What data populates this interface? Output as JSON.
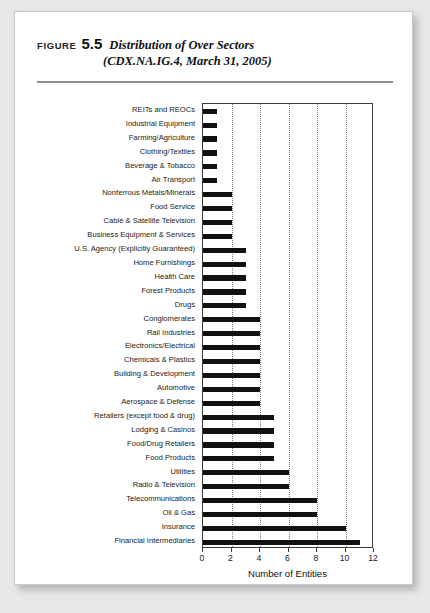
{
  "figure": {
    "label": "FIGURE",
    "number": "5.5",
    "title_line1": "Distribution of Over Sectors",
    "title_line2": "(CDX.NA.IG.4, March 31, 2005)"
  },
  "chart_data": {
    "type": "bar",
    "orientation": "horizontal",
    "title": "Distribution of Over Sectors (CDX.NA.IG.4, March 31, 2005)",
    "xlabel": "Number of Entities",
    "ylabel": "",
    "xlim": [
      0,
      12
    ],
    "xticks": [
      0,
      2,
      4,
      6,
      8,
      10,
      12
    ],
    "xtick_labels": [
      "0",
      "2",
      "4",
      "6",
      "8",
      "10",
      "12"
    ],
    "grid": "vertical-dotted",
    "legend": "none",
    "bar_color": "#111111",
    "categories": [
      "REITs and REOCs",
      "Industrial Equipment",
      "Farming/Agriculture",
      "Clothing/Textiles",
      "Beverage & Tobacco",
      "Air Transport",
      "Nonferrous Metals/Minerals",
      "Food Service",
      "Cable & Satellite Television",
      "Business Equipment & Services",
      "U.S. Agency (Explicitly Guaranteed)",
      "Home Furnishings",
      "Health Care",
      "Forest Products",
      "Drugs",
      "Conglomerates",
      "Rail Industries",
      "Electronics/Electrical",
      "Chemicals & Plastics",
      "Building & Development",
      "Automotive",
      "Aerospace & Defense",
      "Retailers (except food & drug)",
      "Lodging & Casinos",
      "Food/Drug Retailers",
      "Food Products",
      "Utilities",
      "Radio & Television",
      "Telecommunications",
      "Oil & Gas",
      "Insurance",
      "Financial Intermediaries"
    ],
    "values": [
      1,
      1,
      1,
      1,
      1,
      1,
      2,
      2,
      2,
      2,
      3,
      3,
      3,
      3,
      3,
      4,
      4,
      4,
      4,
      4,
      4,
      4,
      5,
      5,
      5,
      5,
      6,
      6,
      8,
      8,
      10,
      11
    ]
  }
}
